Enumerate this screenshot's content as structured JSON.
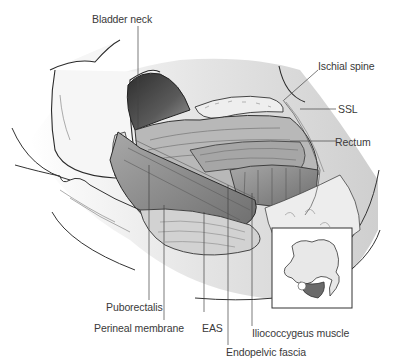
{
  "figure": {
    "type": "anatomical-illustration",
    "colors": {
      "background": "#ffffff",
      "line": "#2a2a2a",
      "muscle_dark": "#6e6e6e",
      "muscle_mid": "#9a9a9a",
      "muscle_light": "#c4c4c4",
      "bone": "#e8e8e8",
      "inset_highlight": "#6a6a6a"
    }
  },
  "labels": {
    "bladder_neck": "Bladder neck",
    "ischial_spine": "Ischial spine",
    "ssl": "SSL",
    "rectum": "Rectum",
    "puborectalis": "Puborectalis",
    "perineal_membrane": "Perineal membrane",
    "eas": "EAS",
    "iliococcygeus_muscle": "Iliococcygeus muscle",
    "endopelvic_fascia": "Endopelvic fascia"
  },
  "inset": {
    "description": "Pelvic bone orientation diagram with shaded region"
  }
}
